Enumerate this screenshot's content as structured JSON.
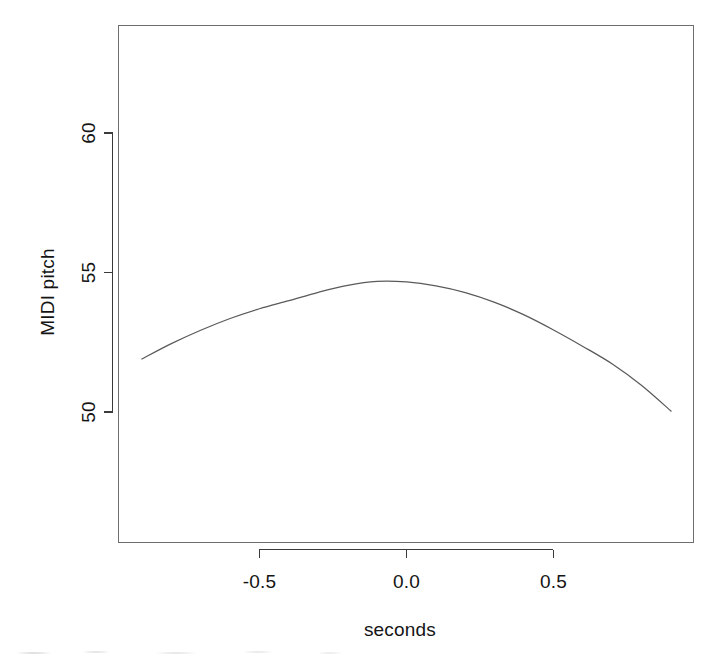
{
  "chart_data": {
    "type": "line",
    "title": "",
    "subtitle": "",
    "xlabel": "seconds",
    "ylabel": "MIDI pitch",
    "grid": false,
    "legend": null,
    "legend_position": "none",
    "xlim": [
      -0.95,
      0.95
    ],
    "ylim": [
      47.3,
      63.9
    ],
    "xticks": [
      -0.5,
      0.0,
      0.5
    ],
    "xtick_labels": [
      "-0.5",
      "0.0",
      "0.5"
    ],
    "yticks": [
      50,
      55,
      60
    ],
    "ytick_labels": [
      "50",
      "55",
      "60"
    ],
    "series": [
      {
        "name": "fitted pitch contour",
        "color": "#5a5a5a",
        "x": [
          -0.9,
          -0.8,
          -0.7,
          -0.6,
          -0.5,
          -0.4,
          -0.3,
          -0.2,
          -0.1,
          0.0,
          0.1,
          0.2,
          0.3,
          0.4,
          0.5,
          0.6,
          0.7,
          0.8,
          0.9
        ],
        "y": [
          51.9,
          52.45,
          52.93,
          53.35,
          53.7,
          53.99,
          54.29,
          54.54,
          54.68,
          54.66,
          54.52,
          54.28,
          53.93,
          53.48,
          52.94,
          52.35,
          51.72,
          50.95,
          50.03
        ]
      }
    ],
    "annotations": []
  },
  "axes": {
    "x_axis_label": "seconds",
    "y_axis_label": "MIDI pitch",
    "x_tick_labels": [
      "-0.5",
      "0.0",
      "0.5"
    ],
    "y_tick_labels": [
      "60",
      "55",
      "50"
    ]
  },
  "colors": {
    "background": "#ffffff",
    "frame": "#6e6e6e",
    "axis": "#3b3b3b",
    "curve": "#5a5a5a",
    "text": "#141414"
  }
}
